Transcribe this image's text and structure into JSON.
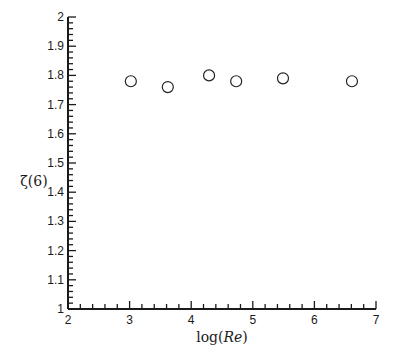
{
  "chart_data": {
    "type": "scatter",
    "title": "",
    "xlabel": "log(Re)",
    "ylabel": "ζ(6)",
    "xlim": [
      2,
      7
    ],
    "ylim": [
      1,
      2
    ],
    "x_ticks": [
      "2",
      "3",
      "4",
      "5",
      "6",
      "7"
    ],
    "y_ticks": [
      "1",
      "1.1",
      "1.2",
      "1.3",
      "1.4",
      "1.5",
      "1.6",
      "1.7",
      "1.8",
      "1.9",
      "2"
    ],
    "grid": false,
    "legend": null,
    "marker": "open-circle",
    "series": [
      {
        "name": "ζ(6)",
        "x": [
          3.02,
          3.62,
          4.29,
          4.73,
          5.49,
          6.61
        ],
        "y": [
          1.78,
          1.76,
          1.8,
          1.78,
          1.79,
          1.78
        ]
      }
    ]
  },
  "labels": {
    "xlabel_prefix": "log(",
    "xlabel_italic": "Re",
    "xlabel_suffix": ")",
    "ylabel_main": "ζ(6)"
  }
}
